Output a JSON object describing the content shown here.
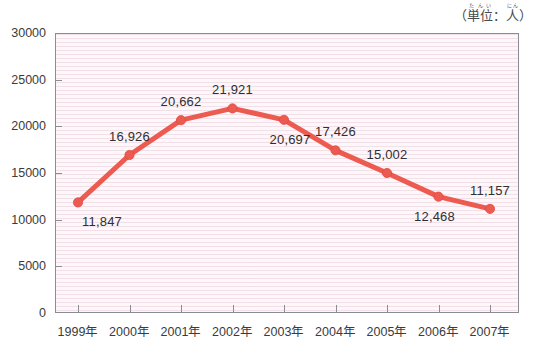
{
  "title": "",
  "unit_caption": {
    "open_paren": "（",
    "word1": "単位",
    "word1_ruby": "たんい",
    "colon": "：",
    "word2": "人",
    "word2_ruby": "にん",
    "close_paren": "）"
  },
  "colors": {
    "series": "#ec5a50",
    "series_dark": "#de4a42",
    "axis": "#8c8c94",
    "plot_background": "#fdf7fa",
    "plot_stripe": "#e9cddb",
    "text": "#3b3b3b"
  },
  "chart_data": {
    "type": "line",
    "title": "",
    "xlabel": "",
    "ylabel": "",
    "unit": "人",
    "categories": [
      "1999年",
      "2000年",
      "2001年",
      "2002年",
      "2003年",
      "2004年",
      "2005年",
      "2006年",
      "2007年"
    ],
    "values": [
      11847,
      16926,
      20662,
      21921,
      20697,
      17426,
      15002,
      12468,
      11157
    ],
    "value_labels": [
      "11,847",
      "16,926",
      "20,662",
      "21,921",
      "20,697",
      "17,426",
      "15,002",
      "12,468",
      "11,157"
    ],
    "label_positions": [
      "below",
      "above",
      "above",
      "above",
      "below",
      "above",
      "above",
      "below",
      "above"
    ],
    "ylim": [
      0,
      30000
    ],
    "ytick_values": [
      0,
      5000,
      10000,
      15000,
      20000,
      25000,
      30000
    ],
    "ytick_labels": [
      "0",
      "5000",
      "10000",
      "15000",
      "20000",
      "25000",
      "30000"
    ],
    "grid": false,
    "legend": false,
    "marker": "circle",
    "line_width": 5
  }
}
